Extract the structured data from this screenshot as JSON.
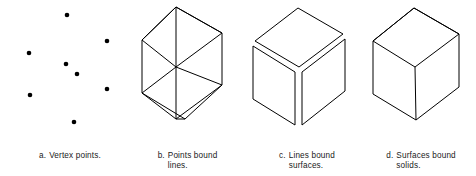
{
  "figure": {
    "background_color": "#ffffff",
    "line_color": "#000000",
    "text_color": "#1a1a1a",
    "panels": [
      {
        "key": "a",
        "label": "a.",
        "caption": "Vertex points.",
        "caption_full": "a.  Vertex points.",
        "type": "vertex-points",
        "point_count": 8,
        "points": [
          {
            "x": 67,
            "y": 15
          },
          {
            "x": 107,
            "y": 41
          },
          {
            "x": 29,
            "y": 53
          },
          {
            "x": 66,
            "y": 64
          },
          {
            "x": 77,
            "y": 74
          },
          {
            "x": 107,
            "y": 89
          },
          {
            "x": 30,
            "y": 95
          },
          {
            "x": 74,
            "y": 122
          }
        ]
      },
      {
        "key": "b",
        "label": "b.",
        "caption": "Points bound\nlines.",
        "caption_full": "b.  Points bound lines.",
        "type": "wireframe-cube",
        "edge_count": 12,
        "description": "Transparent cube drawn as hexagonal outline with three internal edges meeting at center"
      },
      {
        "key": "c",
        "label": "c.",
        "caption": "Lines bound\nsurfaces.",
        "caption_full": "c.  Lines bound surfaces.",
        "type": "exploded-cube-faces",
        "face_count": 3,
        "description": "Three quadrilateral faces slightly separated showing surfaces bounded by lines"
      },
      {
        "key": "d",
        "label": "d.",
        "caption": "Surfaces bound\nsolids.",
        "caption_full": "d.  Surfaces bound solids.",
        "type": "solid-cube",
        "edge_count": 9,
        "description": "Closed solid cube with three visible faces"
      }
    ]
  }
}
